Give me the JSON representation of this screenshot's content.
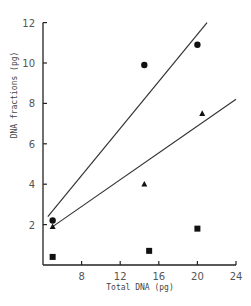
{
  "chart_data": {
    "type": "scatter",
    "title": "",
    "xlabel": "Total DNA (pg)",
    "ylabel": "DNA fractions (pg)",
    "xlim": [
      4,
      24
    ],
    "ylim": [
      0,
      12
    ],
    "x_ticks": [
      8,
      12,
      16,
      20,
      24
    ],
    "y_ticks": [
      2,
      4,
      6,
      8,
      10,
      12
    ],
    "grid": false,
    "legend": null,
    "series": [
      {
        "name": "circles",
        "marker": "circle",
        "points": [
          [
            5,
            2.2
          ],
          [
            14.5,
            9.9
          ],
          [
            20,
            10.9
          ]
        ]
      },
      {
        "name": "triangles",
        "marker": "triangle",
        "points": [
          [
            5,
            1.9
          ],
          [
            14.5,
            4.0
          ],
          [
            20.5,
            7.5
          ]
        ]
      },
      {
        "name": "squares",
        "marker": "square",
        "points": [
          [
            5,
            0.4
          ],
          [
            15,
            0.7
          ],
          [
            20,
            1.8
          ]
        ]
      }
    ],
    "fit_lines": [
      {
        "name": "circles-fit",
        "from": [
          4.5,
          2.4
        ],
        "to": [
          21,
          12
        ]
      },
      {
        "name": "triangles-fit",
        "from": [
          5,
          1.9
        ],
        "to": [
          24,
          8.2
        ]
      }
    ]
  }
}
